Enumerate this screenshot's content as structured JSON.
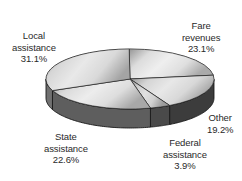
{
  "chart_data": {
    "type": "pie",
    "title": "",
    "style": "3d",
    "categories": [
      "Fare revenues",
      "Other",
      "Federal assistance",
      "State assistance",
      "Local assistance"
    ],
    "values": [
      23.1,
      19.2,
      3.9,
      22.6,
      31.1
    ],
    "unit": "%",
    "labels": [
      {
        "line1": "Fare",
        "line2": "revenues",
        "value": "23.1%"
      },
      {
        "line1": "Other",
        "line2": "",
        "value": "19.2%"
      },
      {
        "line1": "Federal",
        "line2": "assistance",
        "value": "3.9%"
      },
      {
        "line1": "State",
        "line2": "assistance",
        "value": "22.6%"
      },
      {
        "line1": "Local",
        "line2": "assistance",
        "value": "31.1%"
      }
    ],
    "legend": "none"
  }
}
